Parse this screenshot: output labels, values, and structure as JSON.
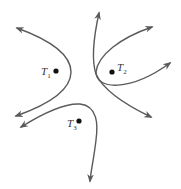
{
  "diagram": {
    "stroke_color": "#5a5a5a",
    "dot_color": "#111111",
    "points": [
      {
        "id": "T1",
        "letter": "T",
        "subscript": "1",
        "x": 56,
        "y": 71
      },
      {
        "id": "T2",
        "letter": "T",
        "subscript": "2",
        "x": 112,
        "y": 72
      },
      {
        "id": "T3",
        "letter": "T",
        "subscript": "3",
        "x": 79,
        "y": 121
      }
    ],
    "curves": [
      {
        "id": "curve-t1",
        "description": "opens left around T1, arrows at both ends"
      },
      {
        "id": "curve-t2-a",
        "description": "from top down past T2 to lower right"
      },
      {
        "id": "curve-t2-b",
        "description": "opens right around T2, arrows at both ends"
      },
      {
        "id": "curve-t3",
        "description": "from left over T3 down to bottom"
      }
    ]
  }
}
